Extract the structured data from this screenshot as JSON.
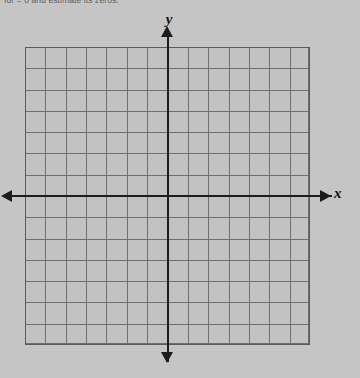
{
  "page": {
    "background_color": "#c5c5c5"
  },
  "instruction": {
    "text": "for  = 0 and estimate its zeros."
  },
  "graph": {
    "name": "blank-coordinate-plane",
    "axis_labels": {
      "x": "x",
      "y": "y"
    },
    "grid": {
      "columns": 14,
      "rows": 14,
      "columns_left_of_y_axis": 7,
      "columns_right_of_y_axis": 7,
      "rows_above_x_axis": 7,
      "rows_below_x_axis": 7,
      "cell_width_px": 20.36,
      "cell_height_px": 21.29,
      "line_color": "#6f6f6f",
      "border_color": "#5a5a5a",
      "fill_color": "#c2c2c2",
      "tick_labels_visible": false
    },
    "axes": {
      "color": "#1c1c1c",
      "x_axis_arrows": "both",
      "y_axis_arrows": "both"
    }
  },
  "chart_data": {
    "type": "scatter",
    "title": "",
    "subtitle": "",
    "xlabel": "x",
    "ylabel": "y",
    "xlim": [
      -7,
      7
    ],
    "ylim": [
      -7,
      7
    ],
    "xticks": [
      -7,
      -6,
      -5,
      -4,
      -3,
      -2,
      -1,
      0,
      1,
      2,
      3,
      4,
      5,
      6,
      7
    ],
    "yticks": [
      -7,
      -6,
      -5,
      -4,
      -3,
      -2,
      -1,
      0,
      1,
      2,
      3,
      4,
      5,
      6,
      7
    ],
    "tick_labels_shown": false,
    "grid": true,
    "legend": null,
    "series": [
      {
        "name": "",
        "x": [],
        "y": []
      }
    ],
    "annotations": [],
    "note": "Empty graph — no data plotted; blank grid provided for student to graph on."
  }
}
